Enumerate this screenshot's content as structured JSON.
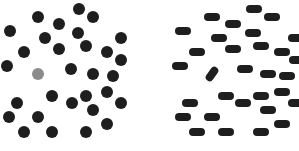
{
  "figure": {
    "colors": {
      "distractor": "#1e1e1e",
      "target_color_panel": "#8c8c8c",
      "background": "#ffffff"
    }
  },
  "left_panel": {
    "name": "color-popout-display",
    "target": {
      "x": 38,
      "y": 74,
      "color": "#8c8c8c"
    },
    "distractors": [
      [
        38,
        17
      ],
      [
        59,
        24
      ],
      [
        79,
        9
      ],
      [
        93,
        17
      ],
      [
        10,
        31
      ],
      [
        45,
        38
      ],
      [
        78,
        33
      ],
      [
        121,
        38
      ],
      [
        24,
        52
      ],
      [
        59,
        49
      ],
      [
        86,
        46
      ],
      [
        107,
        52
      ],
      [
        121,
        60
      ],
      [
        7,
        66
      ],
      [
        71,
        69
      ],
      [
        93,
        74
      ],
      [
        113,
        76
      ],
      [
        52,
        96
      ],
      [
        86,
        96
      ],
      [
        107,
        92
      ],
      [
        17,
        103
      ],
      [
        72,
        103
      ],
      [
        93,
        110
      ],
      [
        121,
        103
      ],
      [
        9,
        117
      ],
      [
        38,
        117
      ],
      [
        107,
        124
      ],
      [
        24,
        132
      ],
      [
        52,
        132
      ],
      [
        86,
        132
      ]
    ]
  },
  "right_panel": {
    "name": "orientation-popout-display",
    "target": {
      "x": 212,
      "y": 74,
      "angle": -55
    },
    "distractors": [
      [
        212,
        17
      ],
      [
        233,
        24
      ],
      [
        254,
        9
      ],
      [
        272,
        17
      ],
      [
        183,
        31
      ],
      [
        219,
        38
      ],
      [
        253,
        33
      ],
      [
        296,
        38
      ],
      [
        197,
        52
      ],
      [
        233,
        49
      ],
      [
        261,
        46
      ],
      [
        282,
        52
      ],
      [
        297,
        60
      ],
      [
        180,
        66
      ],
      [
        245,
        69
      ],
      [
        268,
        74
      ],
      [
        287,
        76
      ],
      [
        226,
        96
      ],
      [
        261,
        96
      ],
      [
        282,
        92
      ],
      [
        190,
        103
      ],
      [
        243,
        103
      ],
      [
        268,
        110
      ],
      [
        296,
        103
      ],
      [
        183,
        117
      ],
      [
        212,
        117
      ],
      [
        282,
        124
      ],
      [
        197,
        132
      ],
      [
        226,
        132
      ],
      [
        261,
        132
      ]
    ]
  }
}
